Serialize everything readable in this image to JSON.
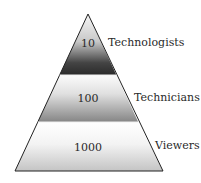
{
  "diagram": {
    "type": "pyramid",
    "tiers": [
      {
        "value": "10",
        "label": "Technologists",
        "gradient_top": "#f4f4f4",
        "gradient_bottom": "#2e2e2e"
      },
      {
        "value": "100",
        "label": "Technicians",
        "gradient_top": "#fafafa",
        "gradient_bottom": "#8a8a8a"
      },
      {
        "value": "1000",
        "label": "Viewers",
        "gradient_top": "#ffffff",
        "gradient_bottom": "#c9c9c9"
      }
    ],
    "outline_color": "#222222"
  }
}
